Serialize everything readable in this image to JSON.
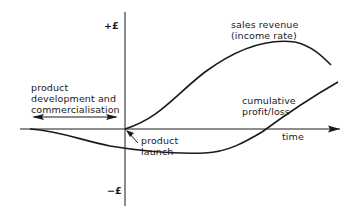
{
  "diagram": {
    "axes": {
      "y_positive_label": "+£",
      "y_negative_label": "−£",
      "x_label": "time"
    },
    "annotations": {
      "development_phase": [
        "product",
        "development and",
        "commercialisation"
      ],
      "launch": [
        "product",
        "launch"
      ]
    },
    "curves": {
      "sales_revenue": [
        "sales revenue",
        "(income rate)"
      ],
      "cumulative": [
        "cumulative",
        "profit/loss"
      ]
    },
    "colors": {
      "line": "#1a1a1a",
      "background": "#ffffff"
    }
  }
}
